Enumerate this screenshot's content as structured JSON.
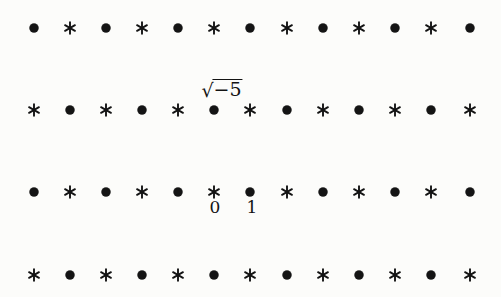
{
  "figure": {
    "background_color": "#fcfcfa",
    "symbol_color": "#141414",
    "width": 501,
    "height": 297,
    "symbols": {
      "dot": "●",
      "star": "*"
    }
  },
  "chart_data": {
    "type": "scatter",
    "title": "",
    "xlabel": "",
    "ylabel": "",
    "grid": false,
    "legend": null,
    "columns": 13,
    "rows": 4,
    "column_x": [
      34,
      70,
      106,
      142,
      178,
      214,
      250,
      287,
      323,
      359,
      395,
      431,
      470
    ],
    "row_y": [
      28,
      110,
      192,
      275
    ],
    "row_patterns": [
      [
        "dot",
        "star",
        "dot",
        "star",
        "dot",
        "star",
        "dot",
        "star",
        "dot",
        "star",
        "dot",
        "star",
        "dot"
      ],
      [
        "star",
        "dot",
        "star",
        "dot",
        "star",
        "dot",
        "star",
        "dot",
        "star",
        "dot",
        "star",
        "dot",
        "star"
      ],
      [
        "dot",
        "star",
        "dot",
        "star",
        "dot",
        "star",
        "dot",
        "star",
        "dot",
        "star",
        "dot",
        "star",
        "dot"
      ],
      [
        "star",
        "dot",
        "star",
        "dot",
        "star",
        "dot",
        "star",
        "dot",
        "star",
        "dot",
        "star",
        "dot",
        "star"
      ]
    ],
    "annotations": [
      {
        "id": "sqrt-minus-five",
        "text": "√−5",
        "radical_sign": "√",
        "radicand": "−5",
        "marks_row": 1,
        "marks_column": 5,
        "marks_symbol": "dot",
        "x": 222,
        "y": 79,
        "position": "above"
      },
      {
        "id": "zero",
        "text": "0",
        "marks_row": 2,
        "marks_column": 5,
        "marks_symbol": "star",
        "x": 215,
        "y": 199,
        "position": "below"
      },
      {
        "id": "one",
        "text": "1",
        "marks_row": 2,
        "marks_column": 6,
        "marks_symbol": "dot",
        "x": 252,
        "y": 199,
        "position": "below"
      }
    ]
  }
}
